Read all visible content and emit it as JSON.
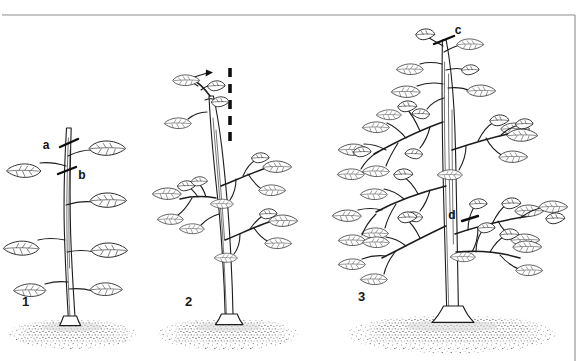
{
  "figure": {
    "background_color": "#ffffff",
    "ink_color": "#1c1c1c",
    "frame_color": "#8d8d8d",
    "width": 588,
    "height": 361
  },
  "frame": {
    "top_rule_y": 15,
    "right_rule_x": 575,
    "has_left_rule": false,
    "has_bottom_rule": false
  },
  "panels": [
    {
      "id": "panel-1",
      "number": "1",
      "number_x": 22,
      "number_y": 305,
      "caption": "Young unpruned plant with a single leader",
      "soil": {
        "center_x": 72,
        "y": 327,
        "width": 120,
        "height": 26
      },
      "stem": {
        "base_x": 70,
        "base_y": 325,
        "top_x": 66,
        "top_y": 128
      },
      "labels": [
        {
          "id": "label-a",
          "text": "a",
          "x": 50,
          "y": 147,
          "cut_x": 68,
          "cut_y": 143,
          "meaning": "upper cut position"
        },
        {
          "id": "label-b",
          "text": "b",
          "x": 80,
          "y": 177,
          "cut_x": 66,
          "cut_y": 170,
          "meaning": "lower cut position above a leaf node"
        }
      ],
      "leaf_count": 7,
      "has_stake": false
    },
    {
      "id": "panel-2",
      "number": "2",
      "number_x": 185,
      "number_y": 305,
      "caption": "Plant after pinching, side shoots breaking, supported by a cane",
      "soil": {
        "center_x": 228,
        "y": 327,
        "width": 130,
        "height": 26
      },
      "stem": {
        "base_x": 228,
        "base_y": 325,
        "top_x": 210,
        "top_y": 95
      },
      "stake": {
        "x": 230,
        "top_y": 68,
        "bottom_y": 142,
        "style": "dashed"
      },
      "growth_arrow": {
        "x": 201,
        "y": 74,
        "direction": "up-right"
      },
      "leaf_count": 14,
      "has_stake": true
    },
    {
      "id": "panel-3",
      "number": "3",
      "number_x": 358,
      "number_y": 300,
      "caption": "Mature bushy plant with many laterals ready for further pruning",
      "soil": {
        "center_x": 450,
        "y": 325,
        "width": 200,
        "height": 30
      },
      "stem": {
        "base_x": 452,
        "base_y": 323,
        "top_x": 444,
        "top_y": 40
      },
      "labels": [
        {
          "id": "label-c",
          "text": "c",
          "x": 457,
          "y": 33,
          "cut_x": 443,
          "cut_y": 40,
          "meaning": "leader tip cut"
        },
        {
          "id": "label-d",
          "text": "d",
          "x": 455,
          "y": 215,
          "cut_x": 470,
          "cut_y": 218,
          "meaning": "lateral branch cut"
        }
      ],
      "leaf_count": 46,
      "has_stake": false
    }
  ],
  "legend": {
    "a": "a",
    "b": "b",
    "c": "c",
    "d": "d"
  }
}
